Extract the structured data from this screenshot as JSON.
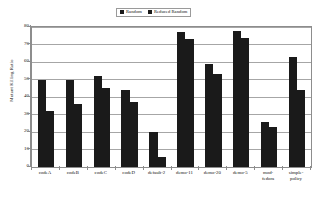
{
  "chart_data": {
    "type": "bar",
    "title": "",
    "xlabel": "",
    "ylabel": "Mutant Killing Ratio",
    "ylim": [
      0,
      80
    ],
    "ytick_labels": [
      "0",
      "10",
      "20",
      "30",
      "40",
      "50",
      "60",
      "70",
      "80"
    ],
    "ytick_values": [
      0,
      10,
      20,
      30,
      40,
      50,
      60,
      70,
      80
    ],
    "grid": true,
    "legend_position": "top-center",
    "categories": [
      "codeA",
      "codeB",
      "codeC",
      "codeD",
      "default-2",
      "demo-11",
      "demo-20",
      "demo-5",
      "mod-\nfedora",
      "simple-\npolicy"
    ],
    "series": [
      {
        "name": "Random",
        "color": "#1a1a1a",
        "values": [
          50,
          50,
          52,
          44,
          20,
          77,
          59,
          78,
          26,
          63
        ]
      },
      {
        "name": "Reduced Random",
        "color": "#1a1a1a",
        "values": [
          32,
          36,
          45,
          37,
          6,
          73,
          53,
          74,
          23,
          44
        ]
      }
    ]
  },
  "legend": {
    "entries": [
      {
        "label": "Random"
      },
      {
        "label": "Reduced Random"
      }
    ]
  },
  "axes": {
    "y_title": "Mutant Killing Ratio"
  }
}
